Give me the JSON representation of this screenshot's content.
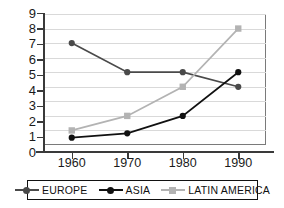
{
  "chart_data": {
    "type": "line",
    "title": "",
    "xlabel": "",
    "ylabel": "",
    "categories": [
      "1960",
      "1970",
      "1980",
      "1990"
    ],
    "x": [
      1960,
      1970,
      1980,
      1990
    ],
    "xlim": [
      1955,
      1995
    ],
    "ylim": [
      0,
      9
    ],
    "yticks": [
      "0",
      "1",
      "2",
      "3",
      "4",
      "5",
      "6",
      "7",
      "8",
      "9"
    ],
    "grid": "horizontal",
    "legend_position": "bottom",
    "series": [
      {
        "name": "EUROPE",
        "values": [
          7,
          5,
          5,
          4
        ],
        "color": "#4a4a4a",
        "marker": "circle"
      },
      {
        "name": "ASIA",
        "values": [
          0.5,
          0.8,
          2,
          5
        ],
        "color": "#111111",
        "marker": "circle"
      },
      {
        "name": "LATIN AMERICA",
        "values": [
          1,
          2,
          4,
          8
        ],
        "color": "#b3b3b3",
        "marker": "square"
      }
    ]
  },
  "legend": {
    "items": [
      {
        "label": "EUROPE"
      },
      {
        "label": "ASIA"
      },
      {
        "label": "LATIN AMERICA"
      }
    ]
  },
  "colors": {
    "europe": "#4a4a4a",
    "asia": "#111111",
    "latin_america": "#b3b3b3",
    "grid": "#d9d9d9",
    "axis": "#3a3a3a",
    "plot_border": "#7a7a7a",
    "text": "#1a1a1a",
    "background": "#ffffff"
  }
}
